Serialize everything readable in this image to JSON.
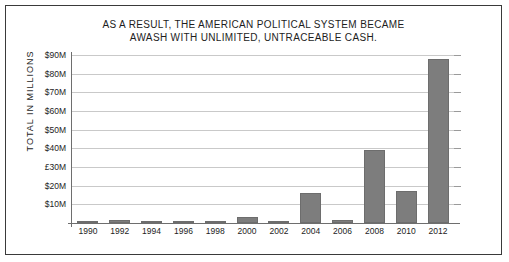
{
  "chart_data": {
    "type": "bar",
    "title_lines": [
      "AS A RESULT, THE AMERICAN POLITICAL SYSTEM BECAME",
      "AWASH WITH UNLIMITED, UNTRACEABLE CASH."
    ],
    "title": "AS A RESULT, THE AMERICAN POLITICAL SYSTEM BECAME AWASH WITH UNLIMITED, UNTRACEABLE CASH.",
    "xlabel": "",
    "ylabel": "TOTAL IN MILLIONS",
    "categories": [
      "1990",
      "1992",
      "1994",
      "1996",
      "1998",
      "2000",
      "2002",
      "2004",
      "2006",
      "2008",
      "2010",
      "2012"
    ],
    "values": [
      1,
      1.5,
      1,
      1,
      1,
      3,
      1,
      16,
      1.5,
      39,
      17,
      88
    ],
    "ylim": [
      0,
      90
    ],
    "ytick_values": [
      10,
      20,
      30,
      40,
      50,
      60,
      70,
      80,
      90
    ],
    "ytick_labels": [
      "$10M",
      "$20M",
      "£30M",
      "$40M",
      "$50M",
      "$60M",
      "$70M",
      "$80M",
      "$90M"
    ],
    "grid": true,
    "legend": false,
    "bar_color": "#7d7d7d",
    "grid_color": "#c9c9c9",
    "axis_color": "#6e6e6e",
    "background": "#ffffff"
  }
}
